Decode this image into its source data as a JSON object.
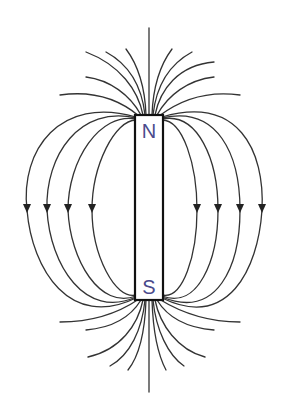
{
  "diagram": {
    "type": "bar-magnet-field-lines",
    "magnet": {
      "north_label": "N",
      "south_label": "S",
      "label_color": "#4a4a8c",
      "outline_color": "#111111"
    },
    "field_lines": {
      "color": "#333333",
      "loops_per_side": 4,
      "arrow_direction": "down",
      "top_fan_lines": 9,
      "bottom_fan_lines": 9
    }
  }
}
